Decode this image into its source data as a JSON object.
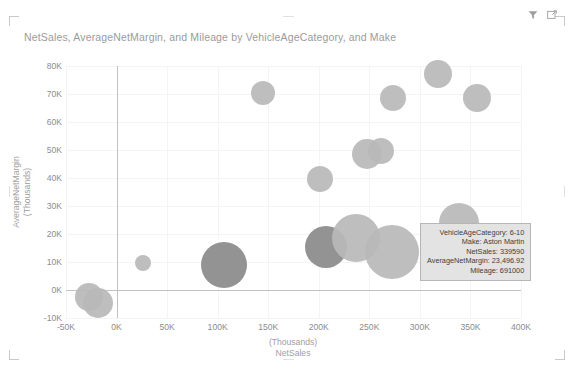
{
  "visual": {
    "title": "NetSales, AverageNetMargin, and Mileage by VehicleAgeCategory, and Make",
    "filter_icon": "filter-icon",
    "focus_icon": "focus-mode-icon",
    "accent_color": "#8c8c8c",
    "bubble_light": "#b9b9b9",
    "bubble_dark": "#8a8a8a",
    "gridline_color": "#f4f4f4",
    "axis_color": "#c2c2c2"
  },
  "tooltip": {
    "lines": [
      "VehicleAgeCategory: 6-10",
      "Make: Aston Martin",
      "NetSales: 339590",
      "AverageNetMargin: 23,496.92",
      "Mileage: 691000"
    ]
  },
  "chart_data": {
    "type": "scatter",
    "title": "NetSales, AverageNetMargin, and Mileage by VehicleAgeCategory, and Make",
    "xlabel": "NetSales",
    "xlabel_unit": "(Thousands)",
    "ylabel": "AverageNetMargin",
    "ylabel_unit": "(Thousands)",
    "xlim": [
      -50000,
      400000
    ],
    "ylim": [
      -10000,
      80000
    ],
    "xticks": [
      -50000,
      0,
      50000,
      100000,
      150000,
      200000,
      250000,
      300000,
      350000,
      400000
    ],
    "xticklabels": [
      "-50K",
      "0K",
      "50K",
      "100K",
      "150K",
      "200K",
      "250K",
      "300K",
      "350K",
      "400K"
    ],
    "yticks": [
      -10000,
      0,
      10000,
      20000,
      30000,
      40000,
      50000,
      60000,
      70000,
      80000
    ],
    "yticklabels": [
      "-10K",
      "0K",
      "10K",
      "20K",
      "30K",
      "40K",
      "50K",
      "60K",
      "70K",
      "80K"
    ],
    "grid": true,
    "legend": "none",
    "size_field": "Mileage",
    "points": [
      {
        "x": -27000,
        "y": -2500,
        "r": 14,
        "shade": "light"
      },
      {
        "x": -18000,
        "y": -4500,
        "r": 15,
        "shade": "light"
      },
      {
        "x": 26000,
        "y": 9500,
        "r": 8,
        "shade": "light"
      },
      {
        "x": 106000,
        "y": 9000,
        "r": 23,
        "shade": "dark"
      },
      {
        "x": 145000,
        "y": 70500,
        "r": 12,
        "shade": "light"
      },
      {
        "x": 201000,
        "y": 39500,
        "r": 13,
        "shade": "light"
      },
      {
        "x": 207000,
        "y": 15500,
        "r": 21,
        "shade": "dark"
      },
      {
        "x": 237000,
        "y": 18500,
        "r": 24,
        "shade": "light"
      },
      {
        "x": 248000,
        "y": 48500,
        "r": 15,
        "shade": "light"
      },
      {
        "x": 262000,
        "y": 49500,
        "r": 13,
        "shade": "light"
      },
      {
        "x": 273000,
        "y": 68500,
        "r": 13,
        "shade": "light"
      },
      {
        "x": 272000,
        "y": 13500,
        "r": 27,
        "shade": "light"
      },
      {
        "x": 318000,
        "y": 77000,
        "r": 14,
        "shade": "light"
      },
      {
        "x": 339000,
        "y": 24000,
        "r": 20,
        "shade": "light"
      },
      {
        "x": 356000,
        "y": 68500,
        "r": 14,
        "shade": "light"
      }
    ]
  }
}
